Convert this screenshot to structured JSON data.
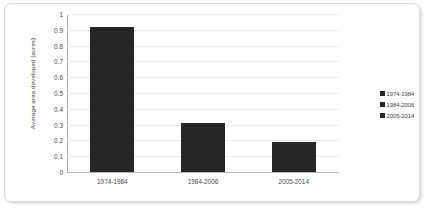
{
  "chart_data": {
    "type": "bar",
    "title": "",
    "xlabel": "",
    "ylabel": "Average area developed (acres)",
    "categories": [
      "1974-1984",
      "1984-2006",
      "2005-2014"
    ],
    "values": [
      0.92,
      0.31,
      0.19
    ],
    "series": [
      {
        "name": "Average area developed (acres)",
        "values": [
          0.92,
          0.31,
          0.19
        ]
      }
    ],
    "ylim": [
      0,
      1
    ],
    "ytick_labels": [
      "1",
      "0.9",
      "0.8",
      "0.7",
      "0.6",
      "0.5",
      "0.4",
      "0.3",
      "0.2",
      "0.1",
      "0"
    ],
    "ytick_values": [
      1,
      0.9,
      0.8,
      0.7,
      0.6,
      0.5,
      0.4,
      0.3,
      0.2,
      0.1,
      0
    ],
    "grid": "horizontal",
    "legend_position": "right",
    "legend": [
      {
        "label": "1974-1984",
        "color": "#262626"
      },
      {
        "label": "1984-2006",
        "color": "#262626"
      },
      {
        "label": "2005-2014",
        "color": "#262626"
      }
    ],
    "bar_color": "#262626",
    "gridline_color": "#e9e9e9",
    "axis_color": "#a9a9a9",
    "border_color": "#d8d8d8"
  }
}
